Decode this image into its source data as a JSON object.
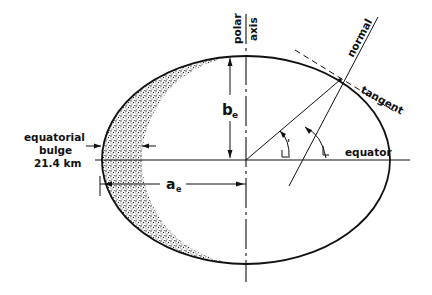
{
  "figure": {
    "type": "ellipsoid cross-section (Earth meridian ellipse)",
    "labels": {
      "polar_axis_line1": "polar",
      "polar_axis_line2": "axis",
      "normal": "normal",
      "tangent": "tangent",
      "equator": "equator",
      "semi_minor": "b",
      "semi_minor_sub": "e",
      "semi_major": "a",
      "semi_major_sub": "e",
      "bulge_line1": "equatorial",
      "bulge_line2": "bulge",
      "bulge_value": "21.4 km",
      "angle_geocentric_mark": "'",
      "angle_geodetic_mark": ""
    },
    "colors": {
      "stroke": "#111111",
      "stipple": "#222222",
      "background": "#ffffff"
    }
  }
}
